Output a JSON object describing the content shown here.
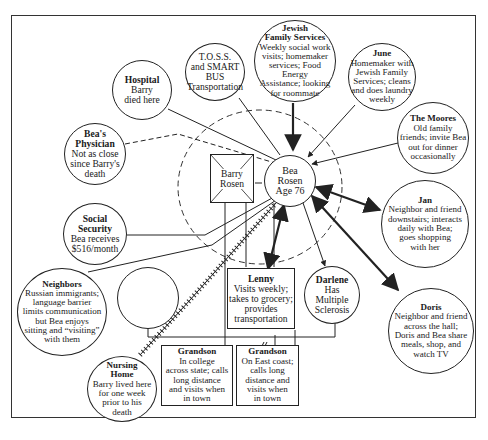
{
  "diagram": {
    "type": "ecomap",
    "center": {
      "name": "Bea Rosen",
      "line1": "Bea",
      "line2": "Rosen",
      "line3": "Age 76"
    },
    "household": {
      "deceased_spouse": {
        "line1": "Barry",
        "line2": "Rosen"
      }
    },
    "nodes": {
      "jfs": {
        "title_1": "Jewish",
        "title_2": "Family Services",
        "desc": [
          "Weekly social work",
          "visits; homemaker",
          "services; Food Energy",
          "Assistance; looking",
          "for roommate"
        ],
        "connection": "strong-inbound"
      },
      "toss": {
        "title": "",
        "desc": [
          "T.O.S.S.",
          "and SMART",
          "BUS",
          "Transportation"
        ],
        "connection": "normal"
      },
      "hospital": {
        "title": "Hospital",
        "desc": [
          "Barry",
          "died here"
        ],
        "connection": "normal"
      },
      "physician": {
        "title_1": "Bea's",
        "title_2": "Physician",
        "desc": [
          "Not as close",
          "since Barry's",
          "death"
        ],
        "connection": "tenuous"
      },
      "june": {
        "title": "June",
        "desc": [
          "Homemaker with",
          "Jewish Family",
          "Services; cleans",
          "and does laundry",
          "weekly"
        ],
        "connection": "inbound"
      },
      "moores": {
        "title": "The Moores",
        "desc": [
          "Old family",
          "friends; invite Bea",
          "out for dinner",
          "occasionally"
        ],
        "connection": "inbound"
      },
      "jan": {
        "title": "Jan",
        "desc": [
          "Neighbor and friend",
          "downstairs; interacts",
          "daily with Bea;",
          "goes shopping",
          "with her"
        ],
        "connection": "strong-bidirectional"
      },
      "social_security": {
        "title": "Social",
        "title_2": "Security",
        "desc": [
          "Bea receives",
          "$516/month"
        ],
        "connection": "normal"
      },
      "neighbors": {
        "title": "Neighbors",
        "desc": [
          "Russian immigrants;",
          "language barrier",
          "limits communication",
          "but Bea enjoys",
          "sitting and “visiting”",
          "with them"
        ],
        "connection": "normal"
      },
      "lenny": {
        "title": "Lenny",
        "desc": [
          "Visits weekly;",
          "takes to grocery;",
          "provides",
          "transportation"
        ],
        "connection": "strong-bidirectional-stressful"
      },
      "darlene": {
        "title": "Darlene",
        "desc": [
          "Has",
          "Multiple",
          "Sclerosis"
        ],
        "connection": "outbound"
      },
      "doris": {
        "title": "Doris",
        "desc": [
          "Neighbor and friend",
          "across the hall;",
          "Doris and Bea share",
          "meals, shop, and",
          "watch TV"
        ],
        "connection": "strong-bidirectional"
      },
      "nursing_home": {
        "title_1": "Nursing",
        "title_2": "Home",
        "desc": [
          "Barry lived here",
          "for one week",
          "prior to his",
          "death"
        ],
        "connection": "stressful"
      },
      "grandson1": {
        "title": "Grandson",
        "desc": [
          "In college",
          "across state; calls",
          "long distance",
          "and visits when",
          "in town"
        ]
      },
      "grandson2": {
        "title": "Grandson",
        "desc": [
          "On East coast;",
          "calls long",
          "distance and",
          "visits when",
          "in town"
        ]
      },
      "unnamed_parent": {
        "title": ""
      }
    },
    "colors": {
      "line": "#222222",
      "background": "#ffffff"
    }
  }
}
